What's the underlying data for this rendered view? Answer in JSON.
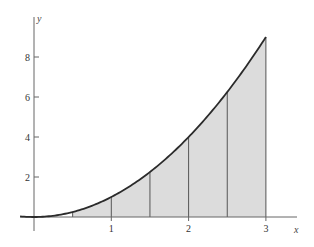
{
  "chart_data": {
    "type": "area",
    "title": "",
    "function": "y = x^2",
    "xlabel": "x",
    "ylabel": "y",
    "xlim": [
      -0.18,
      3.4
    ],
    "ylim": [
      0,
      10
    ],
    "grid": false,
    "legend": null,
    "x_ticks": [
      1,
      2,
      3
    ],
    "x_tick_labels": [
      "1",
      "2",
      "3"
    ],
    "y_ticks": [
      2,
      4,
      6,
      8
    ],
    "y_tick_labels": [
      "2",
      "4",
      "6",
      "8"
    ],
    "shaded_interval": [
      0.5,
      3
    ],
    "partition_x": [
      0.5,
      1,
      1.5,
      2,
      2.5,
      3
    ],
    "partition_y": [
      0.25,
      1,
      2.25,
      4,
      6.25,
      9
    ],
    "curve_points": {
      "x": [
        -0.18,
        0,
        0.5,
        1,
        1.5,
        2,
        2.5,
        3
      ],
      "y": [
        0.0324,
        0,
        0.25,
        1,
        2.25,
        4,
        6.25,
        9
      ]
    },
    "colors": {
      "curve": "#2b2b2b",
      "fill": "#dcdcdc",
      "partition_lines": "#555555",
      "axes": "#666666"
    }
  }
}
